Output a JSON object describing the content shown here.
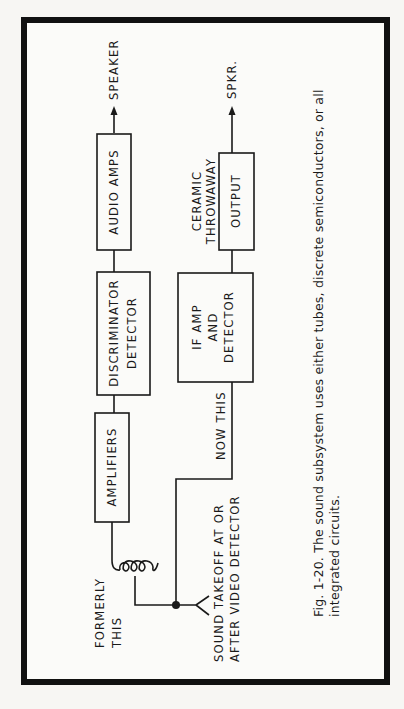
{
  "figure": {
    "caption_line1": "Fig. 1-20. The sound subsystem uses either tubes, discrete semiconductors, or all",
    "caption_line2": "integrated circuits."
  },
  "upper_chain": {
    "output_label": "SPEAKER",
    "blocks": [
      {
        "id": "audio-amps",
        "label": "AUDIO AMPS"
      },
      {
        "id": "discriminator",
        "label_line1": "DISCRIMINATOR",
        "label_line2": "DETECTOR"
      },
      {
        "id": "amplifiers",
        "label": "AMPLIFIERS"
      }
    ],
    "input_label_line1": "FORMERLY",
    "input_label_line2": "THIS"
  },
  "lower_chain": {
    "output_label": "SPKR.",
    "blocks": [
      {
        "id": "output",
        "label": "OUTPUT",
        "note_line1": "CERAMIC",
        "note_line2": "THROWAWAY"
      },
      {
        "id": "if-amp-detector",
        "label_line1": "IF AMP",
        "label_line2": "AND",
        "label_line3": "DETECTOR"
      }
    ],
    "input_label": "NOW THIS"
  },
  "takeoff": {
    "label_line1": "SOUND TAKEOFF AT OR",
    "label_line2": "AFTER VIDEO DETECTOR"
  },
  "colors": {
    "ink": "#1a1a1a",
    "paper": "#f7f6f3",
    "frame": "#111111"
  }
}
